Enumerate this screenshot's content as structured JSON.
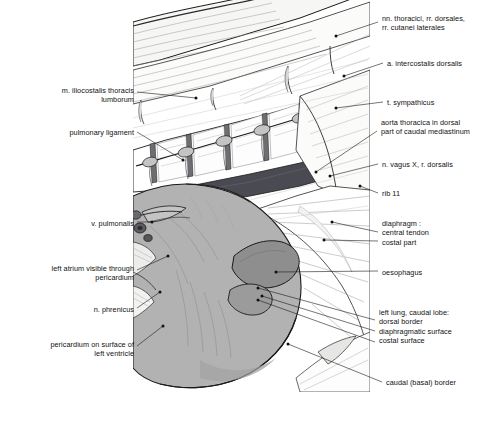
{
  "figure": {
    "colors": {
      "background": "#ffffff",
      "ink": "#111111",
      "lung_fill": "#b2b2b2",
      "lung_shade": "#9a9a9a",
      "oesophagus_fill": "#8e8e8e",
      "aorta_fill": "#4a4a52",
      "muscle_fill": "#e8e8e6",
      "pericardium_fill": "#c9c9c9",
      "vessel_fill": "#5c5c60",
      "faint_line": "#8a8a8a"
    }
  },
  "labels": {
    "left": [
      {
        "name": "m-iliocostalis-thoracis-lumborum",
        "lines": [
          "m. iliocostalis thoracis",
          "lumborum"
        ],
        "x": 18,
        "y": 86,
        "width": 116
      },
      {
        "name": "pulmonary-ligament",
        "lines": [
          "pulmonary ligament"
        ],
        "x": 18,
        "y": 128,
        "width": 116
      },
      {
        "name": "v-pulmonalis",
        "lines": [
          "v. pulmonalis"
        ],
        "x": 18,
        "y": 219,
        "width": 116
      },
      {
        "name": "left-atrium-visible-through-pericardium",
        "lines": [
          "left atrium visible through",
          "pericardium"
        ],
        "x": 6,
        "y": 264,
        "width": 128
      },
      {
        "name": "n-phrenicus",
        "lines": [
          "n. phrenicus"
        ],
        "x": 18,
        "y": 305,
        "width": 116
      },
      {
        "name": "pericardium-on-surface-of-left-ventricle",
        "lines": [
          "pericardium on surface of",
          "left ventricle"
        ],
        "x": 6,
        "y": 340,
        "width": 128
      }
    ],
    "right": [
      {
        "name": "nn-thoracici-rr-dorsales-rr-cutanei-laterales",
        "lines": [
          "nn. thoracici, rr. dorsales,",
          "rr. cutanei laterales"
        ],
        "x": 382,
        "y": 14,
        "width": 106
      },
      {
        "name": "a-intercostalis-dorsalis",
        "lines": [
          "a. intercostalis dorsalis"
        ],
        "x": 387,
        "y": 59,
        "width": 101
      },
      {
        "name": "t-sympathicus",
        "lines": [
          "t. sympathicus"
        ],
        "x": 387,
        "y": 98,
        "width": 101
      },
      {
        "name": "aorta-thoracica-in-dorsal-part-of-caudal-mediastinum",
        "lines": [
          "aorta thoracica in dorsal",
          "part of caudal mediastinum"
        ],
        "x": 381,
        "y": 118,
        "width": 108
      },
      {
        "name": "n-vagus-x-r-dorsalis",
        "lines": [
          "n. vagus X, r. dorsalis"
        ],
        "x": 382,
        "y": 160,
        "width": 106
      },
      {
        "name": "rib-11",
        "lines": [
          "rib 11"
        ],
        "x": 382,
        "y": 189,
        "width": 106
      },
      {
        "name": "diaphragm-group",
        "lines": [
          "diaphragm :",
          "central tendon",
          "costal part"
        ],
        "x": 382,
        "y": 219,
        "width": 106
      },
      {
        "name": "oesophagus",
        "lines": [
          "oesophagus"
        ],
        "x": 382,
        "y": 268,
        "width": 106
      },
      {
        "name": "left-lung-caudal-lobe-group",
        "lines": [
          "left lung, caudal lobe:",
          "dorsal border",
          "diaphragmatic surface",
          "costal surface"
        ],
        "x": 379,
        "y": 308,
        "width": 110
      },
      {
        "name": "caudal-basal-border",
        "lines": [
          "caudal (basal) border"
        ],
        "x": 386,
        "y": 378,
        "width": 103
      }
    ]
  },
  "leaders": {
    "description": "Leader lines connect each label to its anatomical structure",
    "count": 18
  }
}
